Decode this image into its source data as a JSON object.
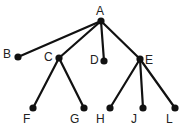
{
  "diagram": {
    "type": "tree",
    "root": "A",
    "nodes": [
      {
        "id": "A",
        "label": "A",
        "x": 101,
        "y": 21,
        "lx": 96,
        "ly": 15
      },
      {
        "id": "B",
        "label": "B",
        "x": 18,
        "y": 57,
        "lx": 3,
        "ly": 58
      },
      {
        "id": "C",
        "label": "C",
        "x": 59,
        "y": 58,
        "lx": 44,
        "ly": 61
      },
      {
        "id": "D",
        "label": "D",
        "x": 104,
        "y": 61,
        "lx": 90,
        "ly": 64
      },
      {
        "id": "E",
        "label": "E",
        "x": 140,
        "y": 59,
        "lx": 145,
        "ly": 64
      },
      {
        "id": "F",
        "label": "F",
        "x": 33,
        "y": 108,
        "lx": 23,
        "ly": 123
      },
      {
        "id": "G",
        "label": "G",
        "x": 84,
        "y": 108,
        "lx": 70,
        "ly": 123
      },
      {
        "id": "H",
        "label": "H",
        "x": 110,
        "y": 108,
        "lx": 96,
        "ly": 123
      },
      {
        "id": "J",
        "label": "J",
        "x": 143,
        "y": 108,
        "lx": 131,
        "ly": 123
      },
      {
        "id": "L",
        "label": "L",
        "x": 175,
        "y": 108,
        "lx": 166,
        "ly": 123
      }
    ],
    "edges": [
      [
        "A",
        "B"
      ],
      [
        "A",
        "C"
      ],
      [
        "A",
        "D"
      ],
      [
        "A",
        "E"
      ],
      [
        "C",
        "F"
      ],
      [
        "C",
        "G"
      ],
      [
        "E",
        "H"
      ],
      [
        "E",
        "J"
      ],
      [
        "E",
        "L"
      ]
    ]
  }
}
